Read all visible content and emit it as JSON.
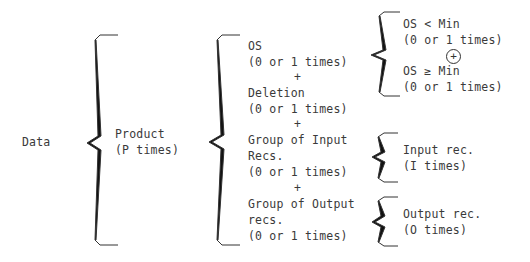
{
  "root": {
    "label": "Data"
  },
  "level1": {
    "label": "Product",
    "repeat": "(P times)"
  },
  "level2": {
    "items": [
      {
        "label": "OS",
        "repeat": "(0 or 1 times)"
      },
      {
        "label": "Deletion",
        "repeat": "(0 or 1 times)"
      },
      {
        "label": "Group of Input",
        "label2": "Recs.",
        "repeat": "(0 or 1 times)"
      },
      {
        "label": "Group of Output",
        "label2": "recs.",
        "repeat": "(0 or 1 times)"
      }
    ],
    "separator": "+"
  },
  "level3": {
    "os": {
      "items": [
        {
          "label": "OS < Min",
          "repeat": "(0 or 1 times)"
        },
        {
          "label": "OS ≥ Min",
          "repeat": "(0 or 1 times)"
        }
      ],
      "separator": "+"
    },
    "input": {
      "label": "Input rec.",
      "repeat": "(I times)"
    },
    "output": {
      "label": "Output rec.",
      "repeat": "(O times)"
    }
  }
}
